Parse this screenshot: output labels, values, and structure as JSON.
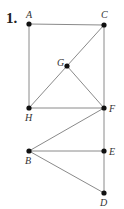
{
  "problem_number": "1.",
  "colors": {
    "edge": "#8a8a8a",
    "point": "#111111",
    "label": "#333333"
  },
  "points": {
    "A": {
      "x": 29,
      "y": 24,
      "label": "A",
      "lx": 26,
      "ly": 18
    },
    "C": {
      "x": 104,
      "y": 25,
      "label": "C",
      "lx": 101,
      "ly": 18
    },
    "G": {
      "x": 67,
      "y": 66,
      "label": "G",
      "lx": 57,
      "ly": 66
    },
    "H": {
      "x": 29,
      "y": 108,
      "label": "H",
      "lx": 25,
      "ly": 121
    },
    "F": {
      "x": 104,
      "y": 108,
      "label": "F",
      "lx": 109,
      "ly": 112
    },
    "B": {
      "x": 29,
      "y": 151,
      "label": "B",
      "lx": 25,
      "ly": 164
    },
    "E": {
      "x": 104,
      "y": 151,
      "label": "E",
      "lx": 109,
      "ly": 155
    },
    "D": {
      "x": 104,
      "y": 193,
      "label": "D",
      "lx": 100,
      "ly": 206
    }
  },
  "edges": [
    [
      "A",
      "C"
    ],
    [
      "A",
      "H"
    ],
    [
      "C",
      "F"
    ],
    [
      "H",
      "F"
    ],
    [
      "H",
      "C"
    ],
    [
      "G",
      "F"
    ],
    [
      "F",
      "D"
    ],
    [
      "B",
      "F"
    ],
    [
      "B",
      "E"
    ],
    [
      "B",
      "D"
    ]
  ]
}
